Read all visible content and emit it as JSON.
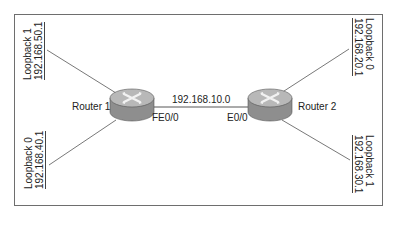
{
  "diagram": {
    "type": "network-topology",
    "routers": [
      {
        "id": "router1",
        "label": "Router 1",
        "interface_label": "FE0/0"
      },
      {
        "id": "router2",
        "label": "Router 2",
        "interface_label": "E0/0"
      }
    ],
    "link": {
      "network": "192.168.10.0",
      "from": "router1",
      "to": "router2"
    },
    "loopbacks": [
      {
        "router": "router1",
        "name": "Loopback 1",
        "address": "192.168.50.1",
        "position": "top-left"
      },
      {
        "router": "router1",
        "name": "Loopback 0",
        "address": "192.168.40.1",
        "position": "bottom-left"
      },
      {
        "router": "router2",
        "name": "Loopback 0",
        "address": "192.168.20.1",
        "position": "top-right"
      },
      {
        "router": "router2",
        "name": "Loopback 1",
        "address": "192.168.30.1",
        "position": "bottom-right"
      }
    ],
    "colors": {
      "border": "#6e6e6e",
      "line": "#444444",
      "router_top": "#b5b5b5",
      "router_side": "#8e8e8e",
      "text": "#222222"
    }
  }
}
